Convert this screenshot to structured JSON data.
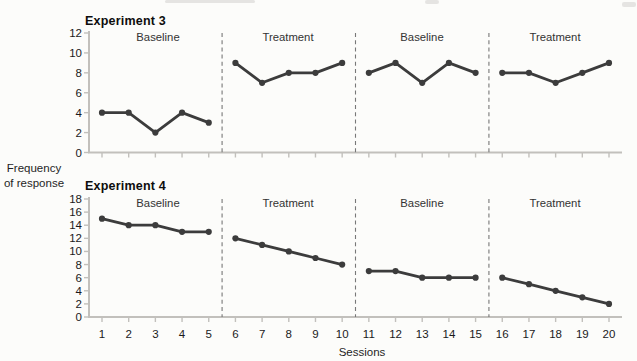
{
  "axis_labels": {
    "y_line1": "Frequency",
    "y_line2": "of response",
    "x": "Sessions"
  },
  "colors": {
    "data_line": "#3c3c3c",
    "axis": "#c2c0bc",
    "phase_separator": "#787878",
    "tick_text": "#1a1a1a"
  },
  "chart_data": [
    {
      "type": "line",
      "title": "Experiment 3",
      "xlabel": "Sessions",
      "ylabel": "Frequency of response",
      "x": [
        1,
        2,
        3,
        4,
        5,
        6,
        7,
        8,
        9,
        10,
        11,
        12,
        13,
        14,
        15,
        16,
        17,
        18,
        19,
        20
      ],
      "values": [
        4,
        4,
        2,
        4,
        3,
        9,
        7,
        8,
        8,
        9,
        8,
        9,
        7,
        9,
        8,
        8,
        8,
        7,
        8,
        9
      ],
      "ylim": [
        0,
        12
      ],
      "yticks": [
        0,
        2,
        4,
        6,
        8,
        10,
        12
      ],
      "grid": false,
      "x_tick_labels_shown": false,
      "phases": [
        {
          "label": "Baseline",
          "sessions": [
            1,
            5
          ]
        },
        {
          "label": "Treatment",
          "sessions": [
            6,
            10
          ]
        },
        {
          "label": "Baseline",
          "sessions": [
            11,
            15
          ]
        },
        {
          "label": "Treatment",
          "sessions": [
            16,
            20
          ]
        }
      ]
    },
    {
      "type": "line",
      "title": "Experiment 4",
      "xlabel": "Sessions",
      "ylabel": "Frequency of response",
      "x": [
        1,
        2,
        3,
        4,
        5,
        6,
        7,
        8,
        9,
        10,
        11,
        12,
        13,
        14,
        15,
        16,
        17,
        18,
        19,
        20
      ],
      "values": [
        15,
        14,
        14,
        13,
        13,
        12,
        11,
        10,
        9,
        8,
        7,
        7,
        6,
        6,
        6,
        6,
        5,
        4,
        3,
        2
      ],
      "ylim": [
        0,
        18
      ],
      "yticks": [
        0,
        2,
        4,
        6,
        8,
        10,
        12,
        14,
        16,
        18
      ],
      "grid": false,
      "x_tick_labels_shown": true,
      "phases": [
        {
          "label": "Baseline",
          "sessions": [
            1,
            5
          ]
        },
        {
          "label": "Treatment",
          "sessions": [
            6,
            10
          ]
        },
        {
          "label": "Baseline",
          "sessions": [
            11,
            15
          ]
        },
        {
          "label": "Treatment",
          "sessions": [
            16,
            20
          ]
        }
      ]
    }
  ]
}
